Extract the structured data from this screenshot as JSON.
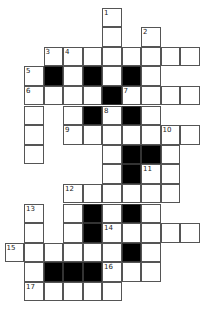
{
  "puzzle": {
    "type": "crossword",
    "rows": 15,
    "cols": 10,
    "colors": {
      "cell": "#ffffff",
      "block": "#000000",
      "border": "#555555"
    },
    "cells": [
      {
        "r": 0,
        "c": 5,
        "n": "1"
      },
      {
        "r": 1,
        "c": 5
      },
      {
        "r": 1,
        "c": 7,
        "n": "2"
      },
      {
        "r": 2,
        "c": 2,
        "n": "3"
      },
      {
        "r": 2,
        "c": 3,
        "n": "4"
      },
      {
        "r": 2,
        "c": 4
      },
      {
        "r": 2,
        "c": 5
      },
      {
        "r": 2,
        "c": 6
      },
      {
        "r": 2,
        "c": 7
      },
      {
        "r": 2,
        "c": 8
      },
      {
        "r": 2,
        "c": 9
      },
      {
        "r": 3,
        "c": 1,
        "n": "5"
      },
      {
        "r": 3,
        "c": 2,
        "b": 1
      },
      {
        "r": 3,
        "c": 3
      },
      {
        "r": 3,
        "c": 4,
        "b": 1
      },
      {
        "r": 3,
        "c": 5
      },
      {
        "r": 3,
        "c": 6,
        "b": 1
      },
      {
        "r": 3,
        "c": 7
      },
      {
        "r": 4,
        "c": 1,
        "n": "6"
      },
      {
        "r": 4,
        "c": 2
      },
      {
        "r": 4,
        "c": 3
      },
      {
        "r": 4,
        "c": 4
      },
      {
        "r": 4,
        "c": 5,
        "b": 1
      },
      {
        "r": 4,
        "c": 6,
        "n": "7"
      },
      {
        "r": 4,
        "c": 7
      },
      {
        "r": 4,
        "c": 8
      },
      {
        "r": 4,
        "c": 9
      },
      {
        "r": 5,
        "c": 1
      },
      {
        "r": 5,
        "c": 3
      },
      {
        "r": 5,
        "c": 4,
        "b": 1
      },
      {
        "r": 5,
        "c": 5,
        "n": "8"
      },
      {
        "r": 5,
        "c": 6,
        "b": 1
      },
      {
        "r": 5,
        "c": 7
      },
      {
        "r": 6,
        "c": 1
      },
      {
        "r": 6,
        "c": 3,
        "n": "9"
      },
      {
        "r": 6,
        "c": 4
      },
      {
        "r": 6,
        "c": 5
      },
      {
        "r": 6,
        "c": 6
      },
      {
        "r": 6,
        "c": 7
      },
      {
        "r": 6,
        "c": 8,
        "n": "10"
      },
      {
        "r": 6,
        "c": 9
      },
      {
        "r": 7,
        "c": 1
      },
      {
        "r": 7,
        "c": 5
      },
      {
        "r": 7,
        "c": 6,
        "b": 1
      },
      {
        "r": 7,
        "c": 7,
        "b": 1
      },
      {
        "r": 7,
        "c": 8
      },
      {
        "r": 8,
        "c": 5
      },
      {
        "r": 8,
        "c": 6,
        "b": 1
      },
      {
        "r": 8,
        "c": 7,
        "n": "11"
      },
      {
        "r": 8,
        "c": 8
      },
      {
        "r": 9,
        "c": 3,
        "n": "12"
      },
      {
        "r": 9,
        "c": 4
      },
      {
        "r": 9,
        "c": 5
      },
      {
        "r": 9,
        "c": 6
      },
      {
        "r": 9,
        "c": 7
      },
      {
        "r": 9,
        "c": 8
      },
      {
        "r": 10,
        "c": 1,
        "n": "13"
      },
      {
        "r": 10,
        "c": 3
      },
      {
        "r": 10,
        "c": 4,
        "b": 1
      },
      {
        "r": 10,
        "c": 5
      },
      {
        "r": 10,
        "c": 6,
        "b": 1
      },
      {
        "r": 10,
        "c": 7
      },
      {
        "r": 11,
        "c": 1
      },
      {
        "r": 11,
        "c": 3
      },
      {
        "r": 11,
        "c": 4,
        "b": 1
      },
      {
        "r": 11,
        "c": 5,
        "n": "14"
      },
      {
        "r": 11,
        "c": 6
      },
      {
        "r": 11,
        "c": 7
      },
      {
        "r": 11,
        "c": 8
      },
      {
        "r": 11,
        "c": 9
      },
      {
        "r": 12,
        "c": 0,
        "n": "15"
      },
      {
        "r": 12,
        "c": 1
      },
      {
        "r": 12,
        "c": 2
      },
      {
        "r": 12,
        "c": 3
      },
      {
        "r": 12,
        "c": 4
      },
      {
        "r": 12,
        "c": 5
      },
      {
        "r": 12,
        "c": 6,
        "b": 1
      },
      {
        "r": 12,
        "c": 7
      },
      {
        "r": 13,
        "c": 1
      },
      {
        "r": 13,
        "c": 2,
        "b": 1
      },
      {
        "r": 13,
        "c": 3,
        "b": 1
      },
      {
        "r": 13,
        "c": 4,
        "b": 1
      },
      {
        "r": 13,
        "c": 5,
        "n": "16"
      },
      {
        "r": 13,
        "c": 6
      },
      {
        "r": 13,
        "c": 7
      },
      {
        "r": 14,
        "c": 1,
        "n": "17"
      },
      {
        "r": 14,
        "c": 2
      },
      {
        "r": 14,
        "c": 3
      },
      {
        "r": 14,
        "c": 4
      },
      {
        "r": 14,
        "c": 5
      }
    ]
  }
}
